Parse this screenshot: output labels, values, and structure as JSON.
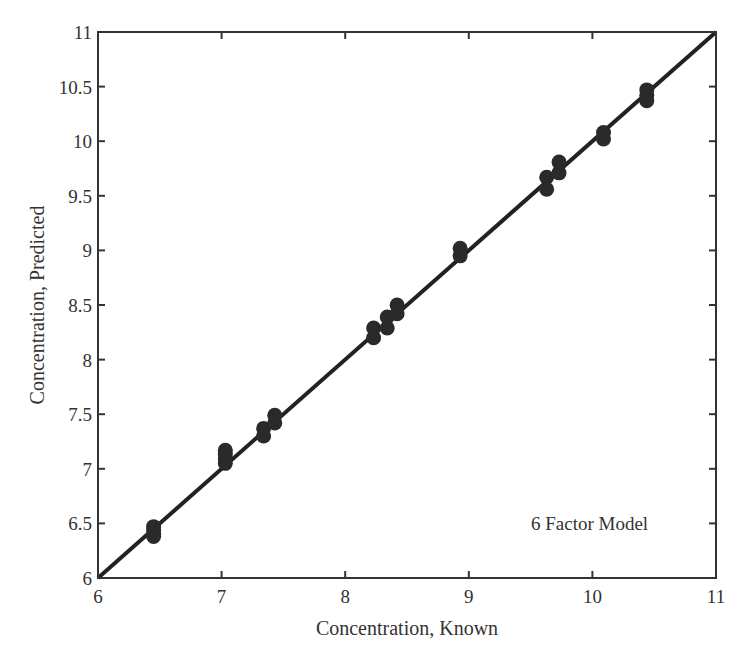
{
  "chart_data": {
    "type": "scatter",
    "title": "",
    "xlabel": "Concentration, Known",
    "ylabel": "Concentration, Predicted",
    "xlim": [
      6,
      11
    ],
    "ylim": [
      6,
      11
    ],
    "xticks": [
      6,
      7,
      8,
      9,
      10,
      11
    ],
    "xtick_labels": [
      "6",
      "7",
      "8",
      "9",
      "10",
      "11"
    ],
    "yticks": [
      6,
      6.5,
      7,
      7.5,
      8,
      8.5,
      9,
      9.5,
      10,
      10.5,
      11
    ],
    "ytick_labels": [
      "6",
      "6.5",
      "7",
      "7.5",
      "8",
      "8.5",
      "9",
      "9.5",
      "10",
      "10.5",
      "11"
    ],
    "grid": false,
    "legend": null,
    "annotations": [
      {
        "text": "6 Factor Model",
        "x": 9.5,
        "y": 6.55
      }
    ],
    "reference_line": {
      "name": "y = x",
      "x": [
        6,
        11
      ],
      "y": [
        6,
        11
      ]
    },
    "series": [
      {
        "name": "Predicted vs Known",
        "marker": "filled-circle",
        "color": "#2a2a2a",
        "points": [
          {
            "x": 6.45,
            "y": 6.47
          },
          {
            "x": 6.45,
            "y": 6.44
          },
          {
            "x": 6.45,
            "y": 6.41
          },
          {
            "x": 6.45,
            "y": 6.38
          },
          {
            "x": 7.03,
            "y": 7.17
          },
          {
            "x": 7.03,
            "y": 7.13
          },
          {
            "x": 7.03,
            "y": 7.09
          },
          {
            "x": 7.03,
            "y": 7.05
          },
          {
            "x": 7.34,
            "y": 7.37
          },
          {
            "x": 7.34,
            "y": 7.3
          },
          {
            "x": 7.43,
            "y": 7.49
          },
          {
            "x": 7.43,
            "y": 7.42
          },
          {
            "x": 8.23,
            "y": 8.29
          },
          {
            "x": 8.23,
            "y": 8.2
          },
          {
            "x": 8.34,
            "y": 8.39
          },
          {
            "x": 8.34,
            "y": 8.29
          },
          {
            "x": 8.42,
            "y": 8.5
          },
          {
            "x": 8.42,
            "y": 8.42
          },
          {
            "x": 8.93,
            "y": 9.02
          },
          {
            "x": 8.93,
            "y": 8.95
          },
          {
            "x": 9.63,
            "y": 9.67
          },
          {
            "x": 9.63,
            "y": 9.56
          },
          {
            "x": 9.73,
            "y": 9.81
          },
          {
            "x": 9.73,
            "y": 9.71
          },
          {
            "x": 10.09,
            "y": 10.08
          },
          {
            "x": 10.09,
            "y": 10.02
          },
          {
            "x": 10.44,
            "y": 10.47
          },
          {
            "x": 10.44,
            "y": 10.42
          },
          {
            "x": 10.44,
            "y": 10.37
          }
        ]
      }
    ]
  },
  "style": {
    "axis_color": "#333333",
    "line_color": "#222222",
    "marker_color": "#2a2a2a",
    "background": "#ffffff"
  }
}
